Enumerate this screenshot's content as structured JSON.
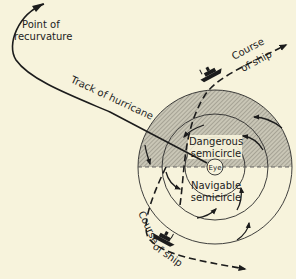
{
  "diagram": {
    "colors": {
      "background": "#f7f3dc",
      "ink": "#1c1c1c",
      "shading": "#b8b5a8"
    },
    "labels": {
      "recurvature_line1": "Point of",
      "recurvature_line2": "recurvature",
      "track": "Track of hurricane",
      "course_top_line1": "Course",
      "course_top_line2": "of ship",
      "course_bottom_line1": "Course",
      "course_bottom_line2": "of ship",
      "eye": "Eye",
      "dangerous_line1": "Dangerous",
      "dangerous_line2": "semicircle",
      "navigable_line1": "Navigable",
      "navigable_line2": "semicircle"
    },
    "icons": {
      "ship": "ship-silhouette",
      "arrow": "wind-direction-arrow"
    }
  }
}
